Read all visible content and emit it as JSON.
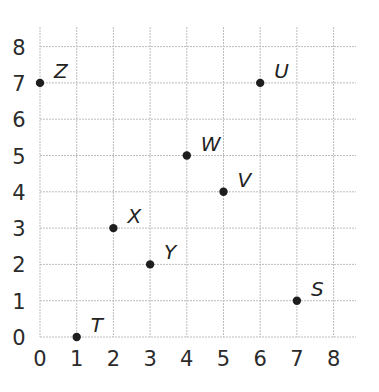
{
  "chart_data": {
    "type": "scatter",
    "title": "",
    "xlabel": "",
    "ylabel": "",
    "xlim": [
      0,
      8
    ],
    "ylim": [
      0,
      8
    ],
    "grid": true,
    "legend": null,
    "x_ticks": [
      "0",
      "1",
      "2",
      "3",
      "4",
      "5",
      "6",
      "7",
      "8"
    ],
    "y_ticks": [
      "0",
      "1",
      "2",
      "3",
      "4",
      "5",
      "6",
      "7",
      "8"
    ],
    "points": [
      {
        "label": "Z",
        "x": 0,
        "y": 7
      },
      {
        "label": "U",
        "x": 6,
        "y": 7
      },
      {
        "label": "W",
        "x": 4,
        "y": 5
      },
      {
        "label": "V",
        "x": 5,
        "y": 4
      },
      {
        "label": "X",
        "x": 2,
        "y": 3
      },
      {
        "label": "Y",
        "x": 3,
        "y": 2
      },
      {
        "label": "S",
        "x": 7,
        "y": 1
      },
      {
        "label": "T",
        "x": 1,
        "y": 0
      }
    ]
  },
  "colors": {
    "grid": "#bdbdbd",
    "point": "#1e1e1e",
    "text": "#2b2b2b"
  }
}
